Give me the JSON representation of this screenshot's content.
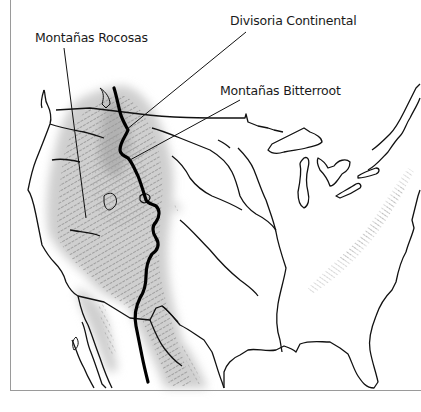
{
  "map": {
    "title": "",
    "region": "Estados Unidos contiguos",
    "labels": {
      "rocky_mountains": "Montañas Rocosas",
      "continental_divide": "Divisoria Continental",
      "bitterroot_mountains": "Montañas Bitterroot"
    },
    "colors": {
      "outline": "#111111",
      "mountain_shading": "#cfcfcf",
      "mountain_hatching": "#444444",
      "divide_line": "#000000",
      "frame": "#9a9a9a",
      "background": "#ffffff"
    },
    "features": [
      "rocky-mountains-relief",
      "appalachian-mountains-relief",
      "continental-divide-line",
      "great-lakes",
      "state-and-country-borders",
      "coastline"
    ]
  }
}
